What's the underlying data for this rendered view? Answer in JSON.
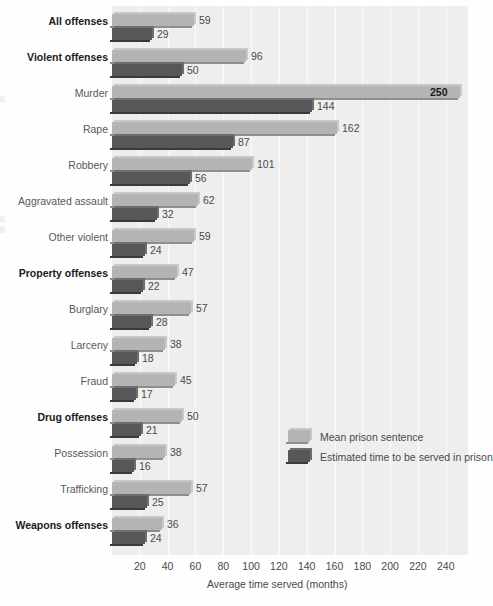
{
  "chart_data": {
    "type": "bar",
    "orientation": "horizontal",
    "title": "",
    "xlabel": "Average time served (months)",
    "ylabel": "",
    "xlim": [
      0,
      256
    ],
    "xticks": [
      20,
      40,
      60,
      80,
      100,
      120,
      140,
      160,
      180,
      200,
      220,
      240
    ],
    "grid": true,
    "legend_position": "center-right",
    "categories": [
      "All offenses",
      "Violent offenses",
      "Murder",
      "Rape",
      "Robbery",
      "Aggravated assault",
      "Other violent",
      "Property offenses",
      "Burglary",
      "Larceny",
      "Fraud",
      "Drug offenses",
      "Possession",
      "Trafficking",
      "Weapons offenses"
    ],
    "category_emphasis": [
      true,
      true,
      false,
      false,
      false,
      false,
      false,
      true,
      false,
      false,
      false,
      true,
      false,
      false,
      true
    ],
    "series": [
      {
        "name": "Mean prison sentence",
        "values": [
          59,
          96,
          250,
          162,
          101,
          62,
          59,
          47,
          57,
          38,
          45,
          50,
          38,
          57,
          36
        ]
      },
      {
        "name": "Estimated time to be served in prison",
        "values": [
          29,
          50,
          144,
          87,
          56,
          32,
          24,
          22,
          28,
          18,
          17,
          21,
          16,
          25,
          24
        ]
      }
    ]
  },
  "legend": {
    "items": [
      {
        "label": "Mean prison sentence",
        "color": "#b4b4b4"
      },
      {
        "label": "Estimated time to be served in prison",
        "color": "#575757"
      }
    ]
  },
  "axis": {
    "x_label": "Average time served (months)",
    "ticks": [
      "20",
      "40",
      "60",
      "80",
      "100",
      "120",
      "140",
      "160",
      "180",
      "200",
      "220",
      "240"
    ]
  },
  "colors": {
    "mean_bar": "#b4b4b4",
    "served_bar": "#575757",
    "plot_background": "#eeeeee",
    "gridline": "#fbfbfb",
    "text": "#4a4a4a",
    "bold_text": "#1a1a1a"
  }
}
